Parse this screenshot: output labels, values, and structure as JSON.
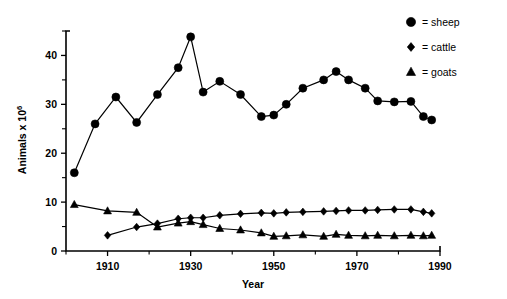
{
  "chart_data": {
    "type": "line",
    "title": "",
    "xlabel": "Year",
    "ylabel": "Animals x 10⁶",
    "xlim": [
      1900,
      1990
    ],
    "ylim": [
      0,
      45
    ],
    "x_ticks_major": [
      1910,
      1930,
      1950,
      1970,
      1990
    ],
    "x_ticks_minor": [
      1900,
      1920,
      1940,
      1960,
      1980
    ],
    "y_ticks_major": [
      0,
      10,
      20,
      30,
      40
    ],
    "y_ticks_minor": [
      5,
      15,
      25,
      35,
      45
    ],
    "grid": false,
    "legend_position": "top-right",
    "series": [
      {
        "name": "sheep",
        "marker": "circle",
        "x": [
          1902,
          1907,
          1912,
          1917,
          1922,
          1927,
          1930,
          1933,
          1937,
          1942,
          1947,
          1950,
          1953,
          1957,
          1962,
          1965,
          1968,
          1972,
          1975,
          1979,
          1983,
          1986,
          1988
        ],
        "values": [
          16.0,
          26.0,
          31.5,
          26.3,
          32.0,
          37.5,
          43.8,
          32.5,
          34.7,
          32.0,
          27.5,
          27.8,
          30.0,
          33.3,
          35.0,
          36.7,
          35.0,
          33.3,
          30.7,
          30.5,
          30.6,
          27.5,
          26.8
        ]
      },
      {
        "name": "cattle",
        "marker": "diamond",
        "x": [
          1910,
          1917,
          1922,
          1927,
          1930,
          1933,
          1937,
          1942,
          1947,
          1950,
          1953,
          1957,
          1962,
          1965,
          1968,
          1972,
          1975,
          1979,
          1983,
          1986,
          1988
        ],
        "values": [
          3.2,
          4.9,
          5.6,
          6.6,
          6.8,
          6.8,
          7.3,
          7.6,
          7.8,
          7.7,
          7.9,
          8.0,
          8.1,
          8.2,
          8.3,
          8.3,
          8.4,
          8.5,
          8.5,
          8.0,
          7.7
        ]
      },
      {
        "name": "goats",
        "marker": "triangle",
        "x": [
          1902,
          1910,
          1917,
          1922,
          1927,
          1930,
          1933,
          1937,
          1942,
          1947,
          1950,
          1953,
          1957,
          1962,
          1965,
          1968,
          1972,
          1975,
          1979,
          1983,
          1986,
          1988
        ],
        "values": [
          9.5,
          8.2,
          7.9,
          4.9,
          5.7,
          6.0,
          5.4,
          4.6,
          4.3,
          3.7,
          3.0,
          3.1,
          3.3,
          3.0,
          3.4,
          3.2,
          3.1,
          3.2,
          3.1,
          3.2,
          3.1,
          3.2
        ]
      }
    ],
    "legend": [
      {
        "marker": "circle",
        "equals": "=",
        "label": "sheep"
      },
      {
        "marker": "diamond",
        "equals": "=",
        "label": "cattle"
      },
      {
        "marker": "triangle",
        "equals": "=",
        "label": "goats"
      }
    ]
  },
  "axis": {
    "y_title": "Animals x 10",
    "y_title_exp": "6",
    "x_title": "Year"
  }
}
